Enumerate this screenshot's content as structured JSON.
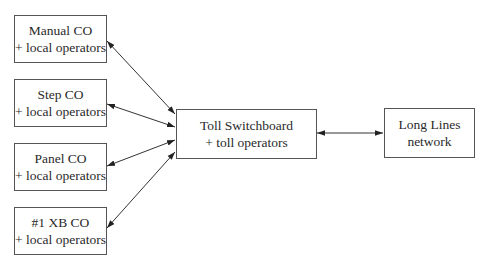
{
  "diagram": {
    "nodes": {
      "manual": {
        "line1": "Manual CO",
        "line2": "+ local operators"
      },
      "step": {
        "line1": "Step CO",
        "line2": "+ local operators"
      },
      "panel": {
        "line1": "Panel CO",
        "line2": "+ local operators"
      },
      "xb": {
        "line1": "#1 XB CO",
        "line2": "+ local operators"
      },
      "toll": {
        "line1": "Toll Switchboard",
        "line2": "+ toll operators"
      },
      "longlines": {
        "line1": "Long Lines",
        "line2": "network"
      }
    },
    "edges": [
      {
        "from": "manual",
        "to": "toll",
        "type": "bidirectional"
      },
      {
        "from": "step",
        "to": "toll",
        "type": "bidirectional"
      },
      {
        "from": "panel",
        "to": "toll",
        "type": "bidirectional"
      },
      {
        "from": "xb",
        "to": "toll",
        "type": "bidirectional"
      },
      {
        "from": "toll",
        "to": "longlines",
        "type": "bidirectional"
      }
    ]
  }
}
